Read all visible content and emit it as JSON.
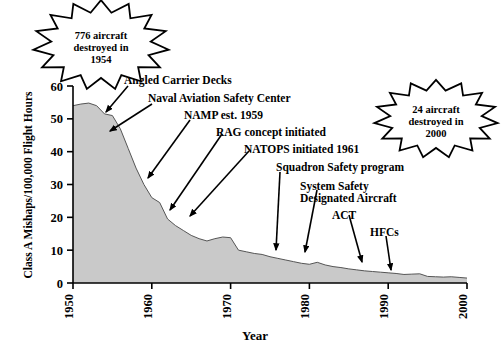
{
  "chart_data": {
    "type": "area",
    "title": "",
    "xlabel": "Year",
    "ylabel": "Class A Mishaps/100,000 Flight Hours",
    "xlim": [
      1950,
      2000
    ],
    "ylim": [
      0,
      60
    ],
    "xticks": [
      "1950",
      "1960",
      "1970",
      "1980",
      "1990",
      "2000"
    ],
    "xtick_values": [
      1950,
      1960,
      1970,
      1980,
      1990,
      2000
    ],
    "yticks": [
      "0",
      "10",
      "20",
      "30",
      "40",
      "50",
      "60"
    ],
    "ytick_values": [
      0,
      10,
      20,
      30,
      40,
      50,
      60
    ],
    "grid": false,
    "legend": "none",
    "series_name": "Class A Mishap Rate",
    "fill_color": "#c9c9c9",
    "line_color": "#555555",
    "x": [
      1950,
      1951,
      1952,
      1953,
      1954,
      1955,
      1956,
      1957,
      1958,
      1959,
      1960,
      1961,
      1962,
      1963,
      1964,
      1965,
      1966,
      1967,
      1968,
      1969,
      1970,
      1971,
      1972,
      1973,
      1974,
      1975,
      1976,
      1977,
      1978,
      1979,
      1980,
      1981,
      1982,
      1983,
      1984,
      1985,
      1986,
      1987,
      1988,
      1989,
      1990,
      1991,
      1992,
      1993,
      1994,
      1995,
      1996,
      1997,
      1998,
      1999,
      2000
    ],
    "values": [
      54.0,
      54.5,
      54.8,
      54.0,
      51.5,
      51.0,
      47.0,
      41.0,
      35.0,
      30.0,
      26.0,
      24.5,
      19.5,
      17.5,
      16.0,
      14.5,
      13.5,
      12.8,
      13.5,
      14.0,
      13.8,
      10.0,
      9.5,
      9.0,
      8.7,
      8.0,
      7.5,
      7.0,
      6.5,
      6.0,
      5.7,
      6.3,
      5.5,
      5.0,
      4.7,
      4.3,
      4.0,
      3.7,
      3.5,
      3.3,
      3.1,
      2.9,
      2.6,
      2.7,
      2.8,
      2.0,
      1.9,
      1.8,
      1.9,
      1.7,
      1.5
    ]
  },
  "annotations": [
    {
      "name": "angled-carrier-decks",
      "text": "Angled Carrier Decks"
    },
    {
      "name": "naval-aviation-safety-center",
      "text": "Naval Aviation Safety Center"
    },
    {
      "name": "namp-est-1959",
      "text": "NAMP est. 1959"
    },
    {
      "name": "rag-concept-initiated",
      "text": "RAG concept initiated"
    },
    {
      "name": "natops-initiated-1961",
      "text": "NATOPS initiated 1961"
    },
    {
      "name": "squadron-safety-program",
      "text": "Squadron Safety program"
    },
    {
      "name": "system-safety-line1",
      "text": "System Safety"
    },
    {
      "name": "system-safety-line2",
      "text": "Designated Aircraft"
    },
    {
      "name": "act",
      "text": "ACT"
    },
    {
      "name": "hfcs",
      "text": "HFCs"
    }
  ],
  "callouts": {
    "left": {
      "line1": "776 aircraft",
      "line2": "destroyed in",
      "line3": "1954"
    },
    "right": {
      "line1": "24 aircraft",
      "line2": "destroyed in",
      "line3": "2000"
    }
  }
}
